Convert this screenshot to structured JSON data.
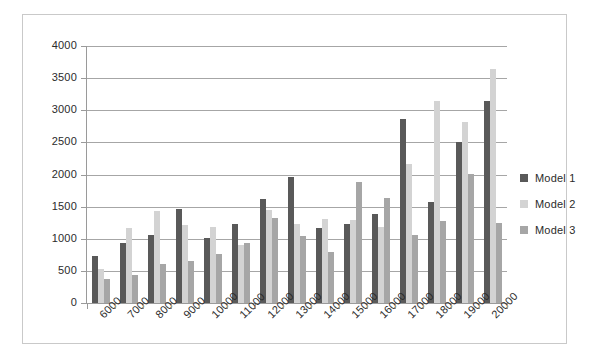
{
  "chart_data": {
    "type": "bar",
    "title": "",
    "subtitle": "",
    "xlabel": "",
    "ylabel": "",
    "grid": true,
    "legend_position": "right",
    "ylim": [
      0,
      4000
    ],
    "y_ticks": [
      0,
      500,
      1000,
      1500,
      2000,
      2500,
      3000,
      3500,
      4000
    ],
    "categories": [
      "6000",
      "7000",
      "8000",
      "9000",
      "10000",
      "11000",
      "12000",
      "13000",
      "14000",
      "15000",
      "16000",
      "17000",
      "18000",
      "19000",
      "20000"
    ],
    "series": [
      {
        "name": "Model 1",
        "color": "#595959",
        "values": [
          730,
          930,
          1055,
          1470,
          1010,
          1230,
          1620,
          1960,
          1160,
          1230,
          1380,
          2860,
          1580,
          2510,
          3150
        ]
      },
      {
        "name": "Model 2",
        "color": "#d3d3d3",
        "values": [
          530,
          1175,
          1430,
          1210,
          1180,
          900,
          1450,
          1230,
          1300,
          1290,
          1180,
          2160,
          3150,
          2820,
          3640
        ]
      },
      {
        "name": "Model 3",
        "color": "#a6a6a6",
        "values": [
          370,
          430,
          605,
          650,
          770,
          935,
          1330,
          1040,
          790,
          1890,
          1640,
          1060,
          1270,
          2010,
          1240
        ]
      }
    ]
  },
  "legend": {
    "items": [
      {
        "label": "Model 1",
        "color": "#595959"
      },
      {
        "label": "Model 2",
        "color": "#d3d3d3"
      },
      {
        "label": "Model 3",
        "color": "#a6a6a6"
      }
    ]
  }
}
